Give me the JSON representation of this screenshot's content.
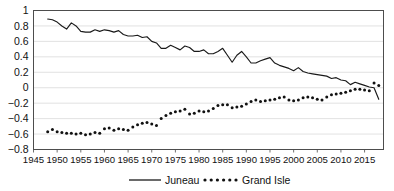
{
  "chart_data": {
    "type": "line",
    "title": "",
    "xlabel": "",
    "ylabel": "",
    "xlim": [
      1945,
      2019
    ],
    "ylim": [
      -0.8,
      1.0
    ],
    "grid": true,
    "legend_position": "bottom",
    "xticks": [
      1945,
      1950,
      1955,
      1960,
      1965,
      1970,
      1975,
      1980,
      1985,
      1990,
      1995,
      2000,
      2005,
      2010,
      2015
    ],
    "ytick_labels": [
      "1",
      "0.8",
      "0.6",
      "0.4",
      "0.2",
      "0",
      "−0.2",
      "−0.4",
      "−0.6",
      "−0.8"
    ],
    "ytick_values": [
      1,
      0.8,
      0.6,
      0.4,
      0.2,
      0,
      -0.2,
      -0.4,
      -0.6,
      -0.8
    ],
    "x": [
      1948,
      1949,
      1950,
      1951,
      1952,
      1953,
      1954,
      1955,
      1956,
      1957,
      1958,
      1959,
      1960,
      1961,
      1962,
      1963,
      1964,
      1965,
      1966,
      1967,
      1968,
      1969,
      1970,
      1971,
      1972,
      1973,
      1974,
      1975,
      1976,
      1977,
      1978,
      1979,
      1980,
      1981,
      1982,
      1983,
      1984,
      1985,
      1986,
      1987,
      1988,
      1989,
      1990,
      1991,
      1992,
      1993,
      1994,
      1995,
      1996,
      1997,
      1998,
      1999,
      2000,
      2001,
      2002,
      2003,
      2004,
      2005,
      2006,
      2007,
      2008,
      2009,
      2010,
      2011,
      2012,
      2013,
      2014,
      2015,
      2016,
      2017,
      2018
    ],
    "series": [
      {
        "name": "Juneau",
        "style": "solid-line",
        "values": [
          0.89,
          0.88,
          0.85,
          0.8,
          0.76,
          0.84,
          0.8,
          0.73,
          0.72,
          0.72,
          0.75,
          0.73,
          0.75,
          0.74,
          0.72,
          0.74,
          0.69,
          0.67,
          0.67,
          0.68,
          0.65,
          0.66,
          0.6,
          0.58,
          0.51,
          0.51,
          0.55,
          0.52,
          0.49,
          0.54,
          0.52,
          0.47,
          0.47,
          0.49,
          0.44,
          0.44,
          0.47,
          0.51,
          0.42,
          0.33,
          0.42,
          0.47,
          0.4,
          0.32,
          0.32,
          0.35,
          0.37,
          0.39,
          0.32,
          0.29,
          0.27,
          0.25,
          0.22,
          0.26,
          0.21,
          0.19,
          0.18,
          0.17,
          0.16,
          0.15,
          0.12,
          0.13,
          0.1,
          0.09,
          0.04,
          0.07,
          0.05,
          0.03,
          0.01,
          0.0,
          -0.15
        ]
      },
      {
        "name": "Grand Isle",
        "style": "dotted-markers",
        "values": [
          -0.57,
          -0.54,
          -0.57,
          -0.58,
          -0.59,
          -0.59,
          -0.6,
          -0.59,
          -0.61,
          -0.6,
          -0.58,
          -0.59,
          -0.53,
          -0.52,
          -0.55,
          -0.53,
          -0.54,
          -0.55,
          -0.51,
          -0.48,
          -0.46,
          -0.45,
          -0.47,
          -0.49,
          -0.4,
          -0.36,
          -0.33,
          -0.31,
          -0.3,
          -0.28,
          -0.34,
          -0.33,
          -0.3,
          -0.31,
          -0.3,
          -0.27,
          -0.23,
          -0.22,
          -0.22,
          -0.26,
          -0.25,
          -0.24,
          -0.21,
          -0.18,
          -0.16,
          -0.18,
          -0.17,
          -0.16,
          -0.15,
          -0.13,
          -0.12,
          -0.16,
          -0.17,
          -0.16,
          -0.13,
          -0.12,
          -0.13,
          -0.15,
          -0.16,
          -0.12,
          -0.09,
          -0.08,
          -0.07,
          -0.06,
          -0.04,
          -0.02,
          -0.02,
          -0.03,
          -0.04,
          0.06,
          0.03
        ]
      }
    ],
    "legend": [
      {
        "label": "Juneau",
        "marker": "solid-line"
      },
      {
        "label": "Grand Isle",
        "marker": "dotted-line"
      }
    ],
    "colors": {
      "series_juneau": "#1a1a1a",
      "series_grand_isle": "#111111",
      "gridline": "#d9d9d9",
      "axis": "#4d4d4d",
      "background": "#ffffff"
    }
  }
}
